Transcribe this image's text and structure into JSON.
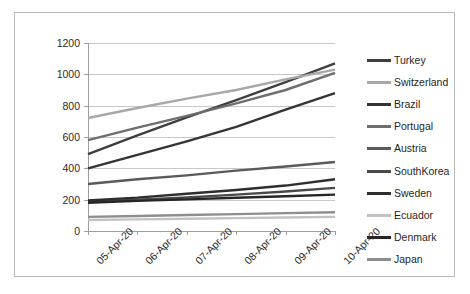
{
  "chart_data": {
    "type": "line",
    "title": "",
    "xlabel": "",
    "ylabel": "",
    "ylim": [
      0,
      1200
    ],
    "yticks": [
      0,
      200,
      400,
      600,
      800,
      1000,
      1200
    ],
    "grid": true,
    "legend_position": "right",
    "categories": [
      "05-Apr-20",
      "06-Apr-20",
      "07-Apr-20",
      "08-Apr-20",
      "09-Apr-20",
      "10-Apr-20"
    ],
    "series": [
      {
        "name": "Turkey",
        "color": "#3f3f3f",
        "values": [
          490,
          610,
          725,
          835,
          950,
          1070
        ]
      },
      {
        "name": "Switzerland",
        "color": "#a8a8a8",
        "values": [
          721,
          785,
          845,
          900,
          968,
          1030
        ]
      },
      {
        "name": "Brazil",
        "color": "#343434",
        "values": [
          400,
          486,
          572,
          665,
          775,
          880
        ]
      },
      {
        "name": "Portugal",
        "color": "#6e6e6e",
        "values": [
          580,
          660,
          735,
          815,
          900,
          1010
        ]
      },
      {
        "name": "Austria",
        "color": "#5a5a5a",
        "values": [
          300,
          330,
          355,
          385,
          412,
          440
        ]
      },
      {
        "name": "SouthKorea",
        "color": "#4a4a4a",
        "values": [
          186,
          200,
          214,
          232,
          252,
          275
        ]
      },
      {
        "name": "Sweden",
        "color": "#2e2e2e",
        "values": [
          195,
          213,
          238,
          262,
          290,
          330
        ]
      },
      {
        "name": "Ecuador",
        "color": "#c2c2c2",
        "values": [
          70,
          74,
          78,
          82,
          86,
          90
        ]
      },
      {
        "name": "Denmark",
        "color": "#262626",
        "values": [
          180,
          192,
          202,
          212,
          222,
          232
        ]
      },
      {
        "name": "Japan",
        "color": "#8e8e8e",
        "values": [
          90,
          96,
          102,
          108,
          114,
          120
        ]
      }
    ]
  },
  "axis": {
    "y_tick_labels": [
      "1200",
      "1000",
      "800",
      "600",
      "400",
      "200",
      "0"
    ],
    "x_tick_labels": [
      "05-Apr-20",
      "06-Apr-20",
      "07-Apr-20",
      "08-Apr-20",
      "09-Apr-20",
      "10-Apr-20"
    ]
  },
  "legend": {
    "items": [
      {
        "label": "Turkey",
        "color": "#3f3f3f"
      },
      {
        "label": "Switzerland",
        "color": "#a8a8a8"
      },
      {
        "label": "Brazil",
        "color": "#343434"
      },
      {
        "label": "Portugal",
        "color": "#6e6e6e"
      },
      {
        "label": "Austria",
        "color": "#5a5a5a"
      },
      {
        "label": "SouthKorea",
        "color": "#4a4a4a"
      },
      {
        "label": "Sweden",
        "color": "#2e2e2e"
      },
      {
        "label": "Ecuador",
        "color": "#c2c2c2"
      },
      {
        "label": "Denmark",
        "color": "#262626"
      },
      {
        "label": "Japan",
        "color": "#8e8e8e"
      }
    ]
  }
}
